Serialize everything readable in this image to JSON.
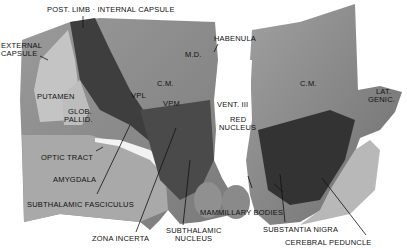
{
  "figure": {
    "labels": {
      "post_limb": "POST. LIMB · INTERNAL CAPSULE",
      "external_capsule_1": "EXTERNAL",
      "external_capsule_2": "CAPSULE",
      "habenula": "HABENULA",
      "md": "M.D.",
      "cm_left": "C.M.",
      "vpl": "VPL",
      "vpm": "VPM",
      "putamen": "PUTAMEN",
      "glob_1": "GLOB.",
      "glob_2": "PALLID.",
      "vent3": "VENT. III",
      "cm_right": "C.M.",
      "lat_genic_1": "LAT.",
      "lat_genic_2": "GENIC.",
      "red_1": "RED",
      "red_2": "NUCLEUS",
      "optic_tract": "OPTIC TRACT",
      "amygdala": "AMYGDALA",
      "subthalamic_fasciculus": "SUBTHALAMIC FASCICULUS",
      "zona_incerta": "ZONA INCERTA",
      "subthalamic_nucleus_1": "SUBTHALAMIC",
      "subthalamic_nucleus_2": "NUCLEUS",
      "mammillary_bodies": "MAMMILLARY BODIES",
      "substantia_nigra": "SUBSTANTIA NIGRA",
      "cerebral_peduncle": "CEREBRAL PEDUNCLE"
    }
  }
}
